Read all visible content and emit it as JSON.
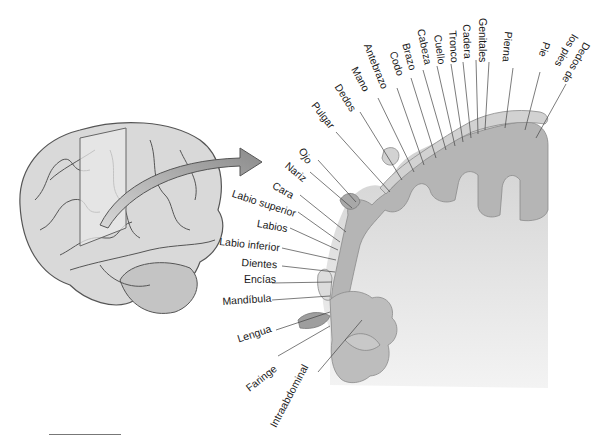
{
  "figure": {
    "labels_top": [
      {
        "id": "pulgar",
        "text": "Pulgar",
        "x": 318,
        "y": 100,
        "rot": 52
      },
      {
        "id": "dedos",
        "text": "Dedos",
        "x": 342,
        "y": 82,
        "rot": 58
      },
      {
        "id": "mano",
        "text": "Mano",
        "x": 359,
        "y": 65,
        "rot": 62
      },
      {
        "id": "antebrazo",
        "text": "Antebrazo",
        "x": 372,
        "y": 42,
        "rot": 68
      },
      {
        "id": "codo",
        "text": "Codo",
        "x": 398,
        "y": 50,
        "rot": 72
      },
      {
        "id": "brazo",
        "text": "Brazo",
        "x": 411,
        "y": 42,
        "rot": 75
      },
      {
        "id": "cabeza",
        "text": "Cabeza",
        "x": 426,
        "y": 28,
        "rot": 78
      },
      {
        "id": "cuello",
        "text": "Cuello",
        "x": 443,
        "y": 34,
        "rot": 82
      },
      {
        "id": "tronco",
        "text": "Tronco",
        "x": 458,
        "y": 30,
        "rot": 86
      },
      {
        "id": "cadera",
        "text": "Cadera",
        "x": 472,
        "y": 24,
        "rot": 88
      },
      {
        "id": "genitales",
        "text": "Genitales",
        "x": 488,
        "y": 18,
        "rot": 90
      },
      {
        "id": "pierna",
        "text": "Pierna",
        "x": 514,
        "y": 32,
        "rot": 95
      },
      {
        "id": "pie",
        "text": "Pie",
        "x": 552,
        "y": 44,
        "rot": 108
      },
      {
        "id": "dedos_pies_1",
        "text": "Dedos de",
        "x": 592,
        "y": 46,
        "rot": 120
      },
      {
        "id": "dedos_pies_2",
        "text": "los pies",
        "x": 580,
        "y": 38,
        "rot": 120
      }
    ],
    "labels_left": [
      {
        "id": "ojo",
        "text": "Ojo",
        "x": 306,
        "y": 146,
        "rot": 60
      },
      {
        "id": "nariz",
        "text": "Nariz",
        "x": 290,
        "y": 160,
        "rot": 40
      },
      {
        "id": "cara",
        "text": "Cara",
        "x": 276,
        "y": 180,
        "rot": 30
      },
      {
        "id": "labio_superior",
        "text": "Labio superior",
        "x": 234,
        "y": 188,
        "rot": 18
      },
      {
        "id": "labios",
        "text": "Labios",
        "x": 258,
        "y": 218,
        "rot": 10
      },
      {
        "id": "labio_inferior",
        "text": "Labio inferior",
        "x": 220,
        "y": 236,
        "rot": 6
      },
      {
        "id": "dientes",
        "text": "Dientes",
        "x": 242,
        "y": 257,
        "rot": 4
      },
      {
        "id": "encias",
        "text": "Encías",
        "x": 244,
        "y": 274,
        "rot": 0
      },
      {
        "id": "mandibula",
        "text": "Mandíbula",
        "x": 222,
        "y": 296,
        "rot": -4
      },
      {
        "id": "lengua",
        "text": "Lengua",
        "x": 236,
        "y": 334,
        "rot": -18
      },
      {
        "id": "faringe",
        "text": "Faringe",
        "x": 244,
        "y": 385,
        "rot": -38
      },
      {
        "id": "intraabdominal",
        "text": "Intraabdominal",
        "x": 268,
        "y": 424,
        "rot": -62
      }
    ],
    "colors": {
      "cortex": "#b9b9b9",
      "white_matter": "#e6e6e6",
      "brain": "#d6d6d6",
      "arrow": "#8a8a8a",
      "text": "#1a1a1a",
      "leader": "#444444"
    }
  }
}
